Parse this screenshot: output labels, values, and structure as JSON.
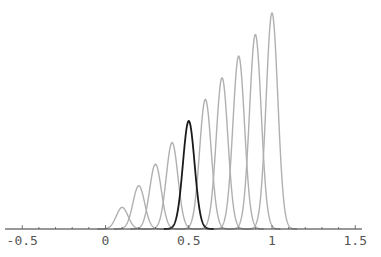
{
  "chart_data": {
    "type": "line",
    "title": "",
    "xlabel": "",
    "ylabel": "",
    "xlim": [
      -0.5,
      1.5
    ],
    "x_ticks": [
      -0.5,
      0,
      0.5,
      1,
      1.5
    ],
    "x_tick_labels": [
      "-0.5",
      "0",
      "0.5",
      "1",
      "1.5"
    ],
    "grid": false,
    "legend": null,
    "sigma": 0.035,
    "series": [
      {
        "name": "t=0.1",
        "center": 0.1,
        "height": 0.1,
        "highlight": false
      },
      {
        "name": "t=0.2",
        "center": 0.2,
        "height": 0.2,
        "highlight": false
      },
      {
        "name": "t=0.3",
        "center": 0.3,
        "height": 0.3,
        "highlight": false
      },
      {
        "name": "t=0.4",
        "center": 0.4,
        "height": 0.4,
        "highlight": false
      },
      {
        "name": "t=0.5",
        "center": 0.5,
        "height": 0.5,
        "highlight": true
      },
      {
        "name": "t=0.6",
        "center": 0.6,
        "height": 0.6,
        "highlight": false
      },
      {
        "name": "t=0.7",
        "center": 0.7,
        "height": 0.7,
        "highlight": false
      },
      {
        "name": "t=0.8",
        "center": 0.8,
        "height": 0.8,
        "highlight": false
      },
      {
        "name": "t=0.9",
        "center": 0.9,
        "height": 0.9,
        "highlight": false
      },
      {
        "name": "t=1.0",
        "center": 1.0,
        "height": 1.0,
        "highlight": false
      }
    ],
    "colors": {
      "normal": "#b0b0b0",
      "highlight": "#1a1a1a",
      "axis": "#333333"
    }
  }
}
